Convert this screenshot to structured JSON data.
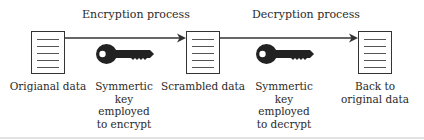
{
  "diagram": {
    "processes": [
      {
        "label": "Encryption process"
      },
      {
        "label": "Decryption process"
      }
    ],
    "nodes": [
      {
        "id": "original",
        "label": "Origianal data"
      },
      {
        "id": "scrambled",
        "label": "Scrambled data"
      },
      {
        "id": "restored",
        "label_lines": [
          "Back to",
          "original data"
        ]
      }
    ],
    "keys": [
      {
        "id": "encrypt-key",
        "label_lines": [
          "Symmertic",
          "key",
          "employed",
          "to encrypt"
        ]
      },
      {
        "id": "decrypt-key",
        "label_lines": [
          "Symmertic",
          "key",
          "employed",
          "to decrypt"
        ]
      }
    ],
    "colors": {
      "line": "#333333",
      "key": "#222222",
      "text": "#2a2a2a"
    }
  }
}
